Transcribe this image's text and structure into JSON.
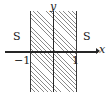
{
  "figure": {
    "background_color": "#ffffff",
    "axis_color": "#262626",
    "hatch_color": "#8a8a8a",
    "label_color": "#1a1a1a"
  },
  "axes": {
    "x_label": "x",
    "y_label": "y"
  },
  "ticks": {
    "left": "−1",
    "right": "1"
  },
  "regions": {
    "left_set_label": "S",
    "right_set_label": "S"
  },
  "chart_data": {
    "type": "area",
    "title": "",
    "xlabel": "x",
    "ylabel": "y",
    "xlim": [
      -1.85,
      1.9
    ],
    "ylim": [
      -1.45,
      1.6
    ],
    "grid": false,
    "legend": null,
    "x_ticks": [
      -1,
      1
    ],
    "x_tick_labels": [
      "−1",
      "1"
    ],
    "y_ticks": [],
    "y_tick_labels": [],
    "shaded_regions": [
      {
        "label": "hatched strip",
        "x_from": -1,
        "x_to": 1,
        "fill": "hatch-45",
        "spans_full_height": true
      }
    ],
    "annotations": [
      {
        "text": "S",
        "x": -1.45,
        "y": 0.62
      },
      {
        "text": "S",
        "x": 1.42,
        "y": 0.62
      },
      {
        "text": "−1",
        "x": -1.0,
        "y": -0.28
      },
      {
        "text": "1",
        "x": 1.0,
        "y": -0.28
      },
      {
        "text": "y",
        "x": 0.0,
        "y": 1.5
      },
      {
        "text": "x",
        "x": 1.85,
        "y": 0.12
      }
    ]
  }
}
